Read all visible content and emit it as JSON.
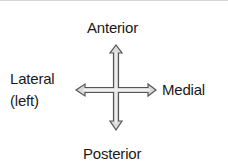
{
  "diagram": {
    "labels": {
      "top": "Anterior",
      "bottom": "Posterior",
      "right": "Medial",
      "left_line1": "Lateral",
      "left_line2": "(left)"
    },
    "arrow_icon": "four-way-arrow-icon",
    "colors": {
      "arrow_fill": "#d9d9d9",
      "arrow_stroke": "#555555",
      "text": "#1a1a1a"
    }
  }
}
